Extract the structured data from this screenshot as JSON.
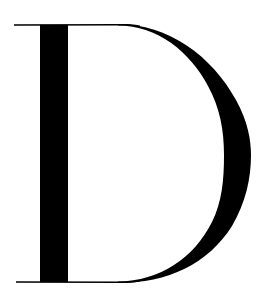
{
  "glyph": {
    "character": "D",
    "style": "high-contrast serif (Didone)",
    "ink_color": "#000000",
    "background_color": "#ffffff"
  }
}
